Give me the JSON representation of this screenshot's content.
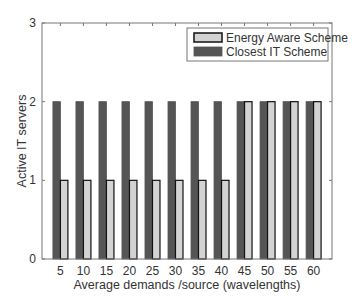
{
  "chart_data": {
    "type": "bar",
    "title": "",
    "xlabel": "Average demands /source (wavelengths)",
    "ylabel": "Active IT servers",
    "categories": [
      "5",
      "10",
      "15",
      "20",
      "25",
      "30",
      "35",
      "40",
      "45",
      "50",
      "55",
      "60"
    ],
    "series": [
      {
        "name": "Energy Aware Scheme",
        "color": "#d3d3d3",
        "edge": "#111111",
        "values": [
          1,
          1,
          1,
          1,
          1,
          1,
          1,
          1,
          2,
          2,
          2,
          2
        ]
      },
      {
        "name": "Closest IT Scheme",
        "color": "#555555",
        "edge": "#555555",
        "values": [
          2,
          2,
          2,
          2,
          2,
          2,
          2,
          2,
          2,
          2,
          2,
          2
        ]
      }
    ],
    "ylim": [
      0,
      3
    ],
    "yticks": [
      "0",
      "1",
      "2",
      "3"
    ],
    "grid": false,
    "legend_position": "upper right"
  }
}
